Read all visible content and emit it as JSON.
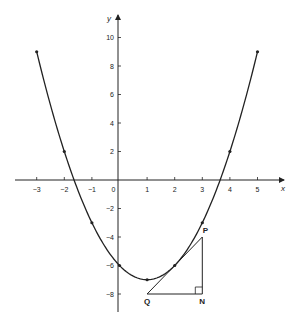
{
  "chart_data": {
    "type": "line",
    "title": "",
    "xlabel": "x",
    "ylabel": "y",
    "function": "y = x^2 - 2x - 6",
    "x": [
      -3,
      -2,
      -1,
      0,
      1,
      2,
      3,
      4,
      5
    ],
    "series": [
      {
        "name": "y = x^2 - 2x - 6",
        "values": [
          9,
          2,
          -3,
          -6,
          -7,
          -6,
          -3,
          2,
          9
        ]
      }
    ],
    "xlim": [
      -3.5,
      6
    ],
    "ylim": [
      -9,
      11
    ],
    "x_ticks": [
      -3,
      -2,
      -1,
      0,
      1,
      2,
      3,
      4,
      5
    ],
    "y_ticks": [
      10,
      8,
      6,
      4,
      2,
      -2,
      -4,
      -6,
      -8
    ],
    "grid": false,
    "annotations": {
      "tangent_point": {
        "x": 2,
        "y": -6
      },
      "tangent_line": "y = 2x - 10",
      "triangle": {
        "P": {
          "label": "P",
          "x": 3,
          "y": -4
        },
        "Q": {
          "label": "Q",
          "x": 1,
          "y": -8
        },
        "N": {
          "label": "N",
          "x": 3,
          "y": -8
        },
        "right_angle_at": "N"
      }
    }
  },
  "labels": {
    "x_axis": "x",
    "y_axis": "y",
    "x_ticks": [
      "−3",
      "−2",
      "−1",
      "0",
      "1",
      "2",
      "3",
      "4",
      "5"
    ],
    "y_ticks": [
      "10",
      "8",
      "6",
      "4",
      "2",
      "−2",
      "−4",
      "−6",
      "−8"
    ],
    "P": "P",
    "Q": "Q",
    "N": "N"
  }
}
